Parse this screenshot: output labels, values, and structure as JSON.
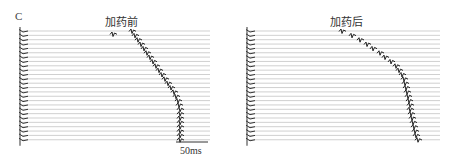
{
  "figure": {
    "panel_label": "C",
    "panels": [
      {
        "id": "before",
        "title": "加药前",
        "title_pos": [
          105,
          13
        ],
        "x_start": 20,
        "x_end": 210,
        "y_start": 31,
        "n_traces": 26,
        "spacing": 4.35,
        "outliers": [
          [
            113,
            34
          ]
        ],
        "spikes_x": [
          132,
          135,
          138,
          141,
          144,
          147,
          150,
          153,
          156,
          159,
          162,
          165,
          168,
          171,
          174,
          176,
          178,
          179,
          180,
          180,
          180,
          180,
          180,
          180,
          180,
          180
        ]
      },
      {
        "id": "after",
        "title": "加药后",
        "title_pos": [
          330,
          13
        ],
        "x_start": 247,
        "x_end": 440,
        "y_start": 31,
        "n_traces": 26,
        "spacing": 4.35,
        "outliers": [],
        "spikes_x": [
          342,
          352,
          360,
          367,
          373,
          380,
          385,
          391,
          396,
          399,
          402,
          404,
          405,
          406,
          407,
          408,
          409,
          410,
          410,
          411,
          412,
          413,
          414,
          415,
          416,
          418
        ]
      }
    ],
    "scale_bar": {
      "label": "50ms",
      "x1": 176,
      "x2": 208,
      "y": 142
    }
  }
}
